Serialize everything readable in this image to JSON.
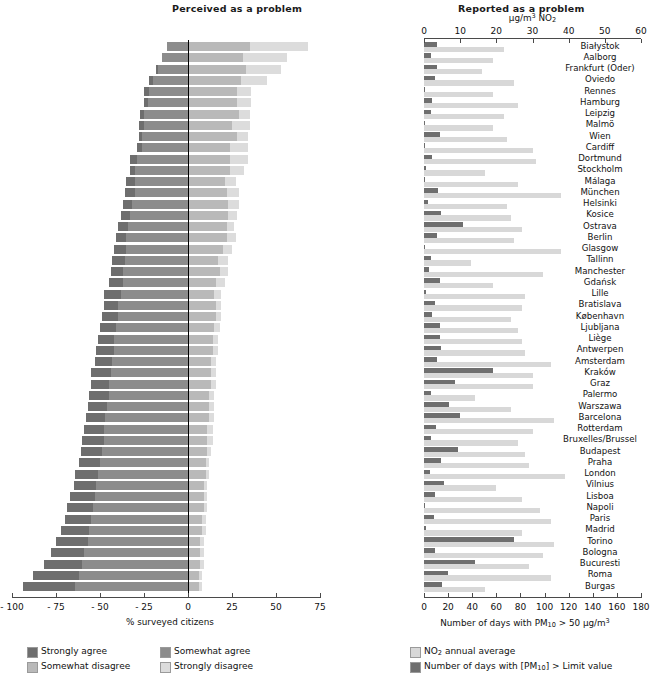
{
  "left_panel": {
    "title": "Perceived as a problem",
    "axis_caption": "% surveyed citizens",
    "ticks": [
      "- 100",
      "- 75",
      "- 50",
      "- 25",
      "0",
      "25",
      "50",
      "75"
    ],
    "legend": [
      {
        "label": "Strongly agree",
        "color": "#6e6e6e"
      },
      {
        "label": "Somewhat agree",
        "color": "#8c8c8c"
      },
      {
        "label": "Somewhat disagree",
        "color": "#b9b9b9"
      },
      {
        "label": "Strongly disagree",
        "color": "#dcdcdc"
      }
    ]
  },
  "right_panel": {
    "title": "Reported as a problem",
    "top_axis_caption": "µg/m³ NO₂",
    "top_ticks": [
      "0",
      "10",
      "20",
      "30",
      "40",
      "50",
      "60"
    ],
    "bottom_axis_caption": "Number of days with PM₁₀ > 50 µg/m³",
    "bottom_ticks": [
      "0",
      "20",
      "40",
      "60",
      "80",
      "100",
      "120",
      "140",
      "160",
      "180"
    ],
    "legend": [
      {
        "label": "NO₂ annual average",
        "color": "#d8d8d8"
      },
      {
        "label": "Number of days with [PM₁₀] > Limit value",
        "color": "#6e6e6e"
      }
    ]
  },
  "chart_data": {
    "type": "bar",
    "left": {
      "type": "bar",
      "orientation": "horizontal",
      "stacked": true,
      "diverging": true,
      "xlabel": "% surveyed citizens",
      "xlim": [
        -100,
        75
      ],
      "xticks": [
        -100,
        -75,
        -50,
        -25,
        0,
        25,
        50,
        75
      ],
      "series": [
        {
          "name": "Strongly agree",
          "color": "#6e6e6e"
        },
        {
          "name": "Somewhat agree",
          "color": "#8c8c8c"
        },
        {
          "name": "Somewhat disagree",
          "color": "#b9b9b9"
        },
        {
          "name": "Strongly disagree",
          "color": "#dcdcdc"
        }
      ]
    },
    "right": {
      "type": "bar",
      "orientation": "horizontal",
      "grouped": true,
      "top_axis": {
        "label": "µg/m³ NO₂",
        "lim": [
          0,
          60
        ],
        "ticks": [
          0,
          10,
          20,
          30,
          40,
          50,
          60
        ]
      },
      "bottom_axis": {
        "label": "Number of days with PM₁₀ > 50 µg/m³",
        "lim": [
          0,
          180
        ],
        "ticks": [
          0,
          20,
          40,
          60,
          80,
          100,
          120,
          140,
          160,
          180
        ]
      },
      "series": [
        {
          "name": "NO₂ annual average",
          "color": "#d8d8d8"
        },
        {
          "name": "Number of days with [PM₁₀] > Limit value",
          "color": "#6e6e6e"
        }
      ]
    },
    "categories": [
      "Białystok",
      "Aalborg",
      "Frankfurt (Oder)",
      "Oviedo",
      "Rennes",
      "Hamburg",
      "Leipzig",
      "Malmö",
      "Wien",
      "Cardiff",
      "Dortmund",
      "Stockholm",
      "Málaga",
      "München",
      "Helsinki",
      "Kosice",
      "Ostrava",
      "Berlin",
      "Glasgow",
      "Tallinn",
      "Manchester",
      "Gdańsk",
      "Lille",
      "Bratislava",
      "København",
      "Ljubljana",
      "Liège",
      "Antwerpen",
      "Amsterdam",
      "Kraków",
      "Graz",
      "Palermo",
      "Warszawa",
      "Barcelona",
      "Rotterdam",
      "Bruxelles/Brussel",
      "Budapest",
      "Praha",
      "London",
      "Vilnius",
      "Lisboa",
      "Napoli",
      "Paris",
      "Madrid",
      "Torino",
      "Bologna",
      "Bucuresti",
      "Roma",
      "Burgas"
    ],
    "rows": [
      {
        "city": "Białystok",
        "strongly_agree": -12,
        "somewhat_agree": -12,
        "somewhat_disagree": 35,
        "strongly_disagree": 33,
        "no2": 22,
        "pm10_days": 11
      },
      {
        "city": "Aalborg",
        "strongly_agree": -15,
        "somewhat_agree": -15,
        "somewhat_disagree": 31,
        "strongly_disagree": 25,
        "no2": 19,
        "pm10_days": 6
      },
      {
        "city": "Frankfurt (Oder)",
        "strongly_agree": -18,
        "somewhat_agree": -17,
        "somewhat_disagree": 33,
        "strongly_disagree": 20,
        "no2": 16,
        "pm10_days": 11
      },
      {
        "city": "Oviedo",
        "strongly_agree": -22,
        "somewhat_agree": -20,
        "somewhat_disagree": 30,
        "strongly_disagree": 15,
        "no2": 25,
        "pm10_days": 9
      },
      {
        "city": "Rennes",
        "strongly_agree": -25,
        "somewhat_agree": -22,
        "somewhat_disagree": 28,
        "strongly_disagree": 8,
        "no2": 19,
        "pm10_days": 0
      },
      {
        "city": "Hamburg",
        "strongly_agree": -25,
        "somewhat_agree": -23,
        "somewhat_disagree": 28,
        "strongly_disagree": 8,
        "no2": 26,
        "pm10_days": 7
      },
      {
        "city": "Leipzig",
        "strongly_agree": -27,
        "somewhat_agree": -25,
        "somewhat_disagree": 29,
        "strongly_disagree": 6,
        "no2": 22,
        "pm10_days": 6
      },
      {
        "city": "Malmö",
        "strongly_agree": -28,
        "somewhat_agree": -25,
        "somewhat_disagree": 25,
        "strongly_disagree": 10,
        "no2": 19,
        "pm10_days": 1
      },
      {
        "city": "Wien",
        "strongly_agree": -28,
        "somewhat_agree": -26,
        "somewhat_disagree": 28,
        "strongly_disagree": 6,
        "no2": 23,
        "pm10_days": 13
      },
      {
        "city": "Cardiff",
        "strongly_agree": -29,
        "somewhat_agree": -26,
        "somewhat_disagree": 24,
        "strongly_disagree": 10,
        "no2": 30,
        "pm10_days": 1
      },
      {
        "city": "Dortmund",
        "strongly_agree": -33,
        "somewhat_agree": -29,
        "somewhat_disagree": 24,
        "strongly_disagree": 10,
        "no2": 31,
        "pm10_days": 7
      },
      {
        "city": "Stockholm",
        "strongly_agree": -33,
        "somewhat_agree": -30,
        "somewhat_disagree": 24,
        "strongly_disagree": 8,
        "no2": 17,
        "pm10_days": 2
      },
      {
        "city": "Málaga",
        "strongly_agree": -35,
        "somewhat_agree": -30,
        "somewhat_disagree": 21,
        "strongly_disagree": 6,
        "no2": 26,
        "pm10_days": 0
      },
      {
        "city": "München",
        "strongly_agree": -36,
        "somewhat_agree": -30,
        "somewhat_disagree": 22,
        "strongly_disagree": 7,
        "no2": 38,
        "pm10_days": 12
      },
      {
        "city": "Helsinki",
        "strongly_agree": -37,
        "somewhat_agree": -32,
        "somewhat_disagree": 23,
        "strongly_disagree": 6,
        "no2": 23,
        "pm10_days": 3
      },
      {
        "city": "Kosice",
        "strongly_agree": -38,
        "somewhat_agree": -33,
        "somewhat_disagree": 23,
        "strongly_disagree": 5,
        "no2": 24,
        "pm10_days": 14
      },
      {
        "city": "Ostrava",
        "strongly_agree": -40,
        "somewhat_agree": -34,
        "somewhat_disagree": 22,
        "strongly_disagree": 4,
        "no2": 27,
        "pm10_days": 32
      },
      {
        "city": "Berlin",
        "strongly_agree": -41,
        "somewhat_agree": -35,
        "somewhat_disagree": 22,
        "strongly_disagree": 5,
        "no2": 25,
        "pm10_days": 11
      },
      {
        "city": "Glasgow",
        "strongly_agree": -42,
        "somewhat_agree": -35,
        "somewhat_disagree": 20,
        "strongly_disagree": 5,
        "no2": 38,
        "pm10_days": 1
      },
      {
        "city": "Tallinn",
        "strongly_agree": -43,
        "somewhat_agree": -36,
        "somewhat_disagree": 17,
        "strongly_disagree": 6,
        "no2": 13,
        "pm10_days": 6
      },
      {
        "city": "Manchester",
        "strongly_agree": -44,
        "somewhat_agree": -37,
        "somewhat_disagree": 18,
        "strongly_disagree": 5,
        "no2": 33,
        "pm10_days": 4
      },
      {
        "city": "Gdańsk",
        "strongly_agree": -45,
        "somewhat_agree": -37,
        "somewhat_disagree": 16,
        "strongly_disagree": 5,
        "no2": 19,
        "pm10_days": 13
      },
      {
        "city": "Lille",
        "strongly_agree": -48,
        "somewhat_agree": -38,
        "somewhat_disagree": 15,
        "strongly_disagree": 4,
        "no2": 28,
        "pm10_days": 2
      },
      {
        "city": "Bratislava",
        "strongly_agree": -48,
        "somewhat_agree": -40,
        "somewhat_disagree": 16,
        "strongly_disagree": 3,
        "no2": 27,
        "pm10_days": 9
      },
      {
        "city": "København",
        "strongly_agree": -49,
        "somewhat_agree": -40,
        "somewhat_disagree": 16,
        "strongly_disagree": 3,
        "no2": 24,
        "pm10_days": 7
      },
      {
        "city": "Ljubljana",
        "strongly_agree": -50,
        "somewhat_agree": -41,
        "somewhat_disagree": 15,
        "strongly_disagree": 3,
        "no2": 26,
        "pm10_days": 13
      },
      {
        "city": "Liège",
        "strongly_agree": -51,
        "somewhat_agree": -42,
        "somewhat_disagree": 14,
        "strongly_disagree": 3,
        "no2": 27,
        "pm10_days": 13
      },
      {
        "city": "Antwerpen",
        "strongly_agree": -52,
        "somewhat_agree": -42,
        "somewhat_disagree": 14,
        "strongly_disagree": 3,
        "no2": 28,
        "pm10_days": 14
      },
      {
        "city": "Amsterdam",
        "strongly_agree": -53,
        "somewhat_agree": -43,
        "somewhat_disagree": 13,
        "strongly_disagree": 3,
        "no2": 35,
        "pm10_days": 11
      },
      {
        "city": "Kraków",
        "strongly_agree": -55,
        "somewhat_agree": -44,
        "somewhat_disagree": 13,
        "strongly_disagree": 3,
        "no2": 30,
        "pm10_days": 57
      },
      {
        "city": "Graz",
        "strongly_agree": -55,
        "somewhat_agree": -45,
        "somewhat_disagree": 13,
        "strongly_disagree": 3,
        "no2": 30,
        "pm10_days": 26
      },
      {
        "city": "Palermo",
        "strongly_agree": -56,
        "somewhat_agree": -45,
        "somewhat_disagree": 12,
        "strongly_disagree": 3,
        "no2": 14,
        "pm10_days": 6
      },
      {
        "city": "Warszawa",
        "strongly_agree": -57,
        "somewhat_agree": -46,
        "somewhat_disagree": 12,
        "strongly_disagree": 3,
        "no2": 24,
        "pm10_days": 21
      },
      {
        "city": "Barcelona",
        "strongly_agree": -58,
        "somewhat_agree": -47,
        "somewhat_disagree": 12,
        "strongly_disagree": 3,
        "no2": 36,
        "pm10_days": 30
      },
      {
        "city": "Rotterdam",
        "strongly_agree": -59,
        "somewhat_agree": -48,
        "somewhat_disagree": 11,
        "strongly_disagree": 3,
        "no2": 30,
        "pm10_days": 10
      },
      {
        "city": "Bruxelles/Brussel",
        "strongly_agree": -60,
        "somewhat_agree": -48,
        "somewhat_disagree": 11,
        "strongly_disagree": 3,
        "no2": 26,
        "pm10_days": 6
      },
      {
        "city": "Budapest",
        "strongly_agree": -61,
        "somewhat_agree": -49,
        "somewhat_disagree": 11,
        "strongly_disagree": 2,
        "no2": 28,
        "pm10_days": 28
      },
      {
        "city": "Praha",
        "strongly_agree": -62,
        "somewhat_agree": -50,
        "somewhat_disagree": 10,
        "strongly_disagree": 2,
        "no2": 29,
        "pm10_days": 14
      },
      {
        "city": "London",
        "strongly_agree": -64,
        "somewhat_agree": -51,
        "somewhat_disagree": 10,
        "strongly_disagree": 2,
        "no2": 39,
        "pm10_days": 5
      },
      {
        "city": "Vilnius",
        "strongly_agree": -65,
        "somewhat_agree": -52,
        "somewhat_disagree": 9,
        "strongly_disagree": 2,
        "no2": 20,
        "pm10_days": 17
      },
      {
        "city": "Lisboa",
        "strongly_agree": -67,
        "somewhat_agree": -53,
        "somewhat_disagree": 9,
        "strongly_disagree": 2,
        "no2": 27,
        "pm10_days": 9
      },
      {
        "city": "Napoli",
        "strongly_agree": -69,
        "somewhat_agree": -54,
        "somewhat_disagree": 9,
        "strongly_disagree": 2,
        "no2": 32,
        "pm10_days": 1
      },
      {
        "city": "Paris",
        "strongly_agree": -70,
        "somewhat_agree": -55,
        "somewhat_disagree": 8,
        "strongly_disagree": 2,
        "no2": 35,
        "pm10_days": 8
      },
      {
        "city": "Madrid",
        "strongly_agree": -72,
        "somewhat_agree": -56,
        "somewhat_disagree": 8,
        "strongly_disagree": 2,
        "no2": 27,
        "pm10_days": 2
      },
      {
        "city": "Torino",
        "strongly_agree": -75,
        "somewhat_agree": -57,
        "somewhat_disagree": 7,
        "strongly_disagree": 2,
        "no2": 36,
        "pm10_days": 75
      },
      {
        "city": "Bologna",
        "strongly_agree": -78,
        "somewhat_agree": -59,
        "somewhat_disagree": 7,
        "strongly_disagree": 2,
        "no2": 33,
        "pm10_days": 9
      },
      {
        "city": "Bucuresti",
        "strongly_agree": -82,
        "somewhat_agree": -60,
        "somewhat_disagree": 7,
        "strongly_disagree": 2,
        "no2": 29,
        "pm10_days": 42
      },
      {
        "city": "Roma",
        "strongly_agree": -88,
        "somewhat_agree": -62,
        "somewhat_disagree": 6,
        "strongly_disagree": 2,
        "no2": 35,
        "pm10_days": 20
      },
      {
        "city": "Burgas",
        "strongly_agree": -94,
        "somewhat_agree": -64,
        "somewhat_disagree": 6,
        "strongly_disagree": 2,
        "no2": 17,
        "pm10_days": 15
      }
    ]
  }
}
